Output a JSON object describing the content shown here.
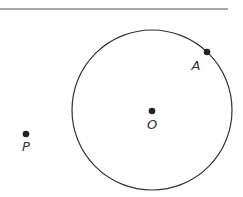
{
  "diagram": {
    "top_rule": {
      "x1": 0,
      "y1": 9,
      "x2": 228,
      "y2": 9
    },
    "circle": {
      "cx": 152,
      "cy": 110,
      "r": 80,
      "stroke": "#333333"
    },
    "points": [
      {
        "id": "A",
        "label": "A",
        "x": 207,
        "y": 52,
        "lx": 196,
        "ly": 70
      },
      {
        "id": "O",
        "label": "O",
        "x": 152,
        "y": 111,
        "lx": 152,
        "ly": 129
      },
      {
        "id": "P",
        "label": "P",
        "x": 26,
        "y": 134,
        "lx": 26,
        "ly": 151
      }
    ]
  }
}
